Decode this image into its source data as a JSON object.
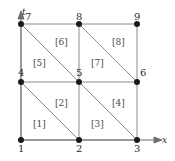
{
  "figure": {
    "kind": "finite-element-mesh-diagram",
    "background_color": "#ffffff",
    "line_color": "#8c8c8c",
    "axis_color": "#6e6e6e",
    "node_color": "#1a1a1a",
    "text_color": "#2b2b2b",
    "element_label_color": "#4a4a4a"
  },
  "axes": {
    "vertical": {
      "label": "t",
      "x": 22,
      "y": 8,
      "arrow": "up"
    },
    "horizontal": {
      "label": "x",
      "x": 162,
      "y": 136,
      "arrow": "right"
    }
  },
  "nodes": [
    {
      "id": "1",
      "cx": 21,
      "cy": 140,
      "label": "1",
      "lx": 18,
      "ly": 144
    },
    {
      "id": "2",
      "cx": 79,
      "cy": 140,
      "label": "2",
      "lx": 76,
      "ly": 144
    },
    {
      "id": "3",
      "cx": 137,
      "cy": 140,
      "label": "3",
      "lx": 134,
      "ly": 144
    },
    {
      "id": "4",
      "cx": 21,
      "cy": 82,
      "label": "4",
      "lx": 18,
      "ly": 68
    },
    {
      "id": "5",
      "cx": 79,
      "cy": 82,
      "label": "5",
      "lx": 76,
      "ly": 68
    },
    {
      "id": "6",
      "cx": 137,
      "cy": 82,
      "label": "6",
      "lx": 140,
      "ly": 68
    },
    {
      "id": "7",
      "cx": 21,
      "cy": 24,
      "label": "7",
      "lx": 25,
      "ly": 12
    },
    {
      "id": "8",
      "cx": 79,
      "cy": 24,
      "label": "8",
      "lx": 76,
      "ly": 12
    },
    {
      "id": "9",
      "cx": 137,
      "cy": 24,
      "label": "9",
      "lx": 134,
      "ly": 12
    }
  ],
  "edges": [
    {
      "name": "bottom-axis-1-2",
      "x1": 21,
      "y1": 140,
      "x2": 79,
      "y2": 140
    },
    {
      "name": "bottom-axis-2-3",
      "x1": 79,
      "y1": 140,
      "x2": 137,
      "y2": 140
    },
    {
      "name": "horizontal-4-5",
      "x1": 21,
      "y1": 82,
      "x2": 79,
      "y2": 82
    },
    {
      "name": "horizontal-5-6",
      "x1": 79,
      "y1": 82,
      "x2": 137,
      "y2": 82
    },
    {
      "name": "horizontal-7-8",
      "x1": 21,
      "y1": 24,
      "x2": 79,
      "y2": 24
    },
    {
      "name": "horizontal-8-9",
      "x1": 79,
      "y1": 24,
      "x2": 137,
      "y2": 24
    },
    {
      "name": "vertical-1-4",
      "x1": 21,
      "y1": 140,
      "x2": 21,
      "y2": 82
    },
    {
      "name": "vertical-4-7",
      "x1": 21,
      "y1": 82,
      "x2": 21,
      "y2": 24
    },
    {
      "name": "vertical-2-5",
      "x1": 79,
      "y1": 140,
      "x2": 79,
      "y2": 82
    },
    {
      "name": "vertical-5-8",
      "x1": 79,
      "y1": 82,
      "x2": 79,
      "y2": 24
    },
    {
      "name": "vertical-3-6",
      "x1": 137,
      "y1": 140,
      "x2": 137,
      "y2": 82
    },
    {
      "name": "vertical-6-9",
      "x1": 137,
      "y1": 82,
      "x2": 137,
      "y2": 24
    },
    {
      "name": "diagonal-4-2",
      "x1": 21,
      "y1": 82,
      "x2": 79,
      "y2": 140
    },
    {
      "name": "diagonal-5-3",
      "x1": 79,
      "y1": 82,
      "x2": 137,
      "y2": 140
    },
    {
      "name": "diagonal-7-5",
      "x1": 21,
      "y1": 24,
      "x2": 79,
      "y2": 82
    },
    {
      "name": "diagonal-8-6",
      "x1": 79,
      "y1": 24,
      "x2": 137,
      "y2": 82
    }
  ],
  "elements": [
    {
      "id": "1",
      "label": "[1]",
      "lx": 33,
      "ly": 120
    },
    {
      "id": "2",
      "label": "[2]",
      "lx": 55,
      "ly": 99
    },
    {
      "id": "3",
      "label": "[3]",
      "lx": 91,
      "ly": 120
    },
    {
      "id": "4",
      "label": "[4]",
      "lx": 112,
      "ly": 99
    },
    {
      "id": "5",
      "label": "[5]",
      "lx": 33,
      "ly": 59
    },
    {
      "id": "6",
      "label": "[6]",
      "lx": 55,
      "ly": 38
    },
    {
      "id": "7",
      "label": "[7]",
      "lx": 91,
      "ly": 59
    },
    {
      "id": "8",
      "label": "[8]",
      "lx": 112,
      "ly": 38
    }
  ]
}
